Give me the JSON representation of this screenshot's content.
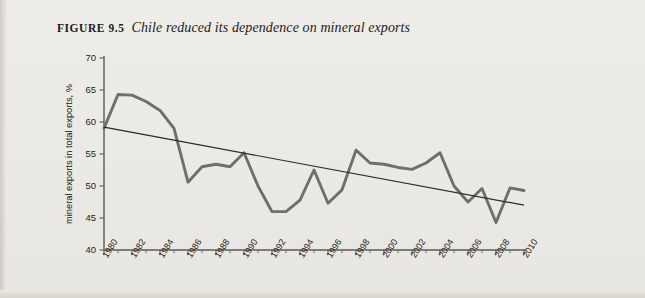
{
  "figure": {
    "number": "FIGURE 9.5",
    "title": "Chile reduced its dependence on mineral exports"
  },
  "chart_data": {
    "type": "line",
    "title": "Chile reduced its dependence on mineral exports",
    "xlabel": "",
    "ylabel": "mineral exports in total exports, %",
    "xlim": [
      1980,
      2010
    ],
    "ylim": [
      40,
      70
    ],
    "yticks": [
      40,
      45,
      50,
      55,
      60,
      65,
      70
    ],
    "xticks": [
      1980,
      1982,
      1984,
      1986,
      1988,
      1990,
      1992,
      1994,
      1996,
      1998,
      2000,
      2002,
      2004,
      2006,
      2008,
      2010
    ],
    "xtick_labels": [
      "1980",
      "1982",
      "1984",
      "1986",
      "1988",
      "1990",
      "1992",
      "1994",
      "1996",
      "1998",
      "2000",
      "2002",
      "2004",
      "2006",
      "2008",
      "2010"
    ],
    "grid": false,
    "legend": null,
    "series": [
      {
        "name": "mineral exports in total exports, %",
        "color": "#6e6e6e",
        "x": [
          1980,
          1981,
          1982,
          1983,
          1984,
          1985,
          1986,
          1987,
          1988,
          1989,
          1990,
          1991,
          1992,
          1993,
          1994,
          1995,
          1996,
          1997,
          1998,
          1999,
          2000,
          2001,
          2002,
          2003,
          2004,
          2005,
          2006,
          2007,
          2008,
          2009,
          2010
        ],
        "values": [
          59.0,
          64.3,
          64.2,
          63.2,
          61.8,
          59.0,
          50.6,
          53.0,
          53.4,
          53.0,
          55.2,
          50.0,
          46.0,
          46.0,
          47.8,
          52.5,
          47.3,
          49.4,
          55.6,
          53.6,
          53.4,
          52.9,
          52.6,
          53.6,
          55.2,
          50.0,
          47.5,
          49.6,
          44.3,
          49.7,
          49.3
        ]
      },
      {
        "name": "trend",
        "color": "#2a2a2a",
        "x": [
          1980,
          2010
        ],
        "values": [
          59.2,
          47.0
        ]
      }
    ]
  }
}
